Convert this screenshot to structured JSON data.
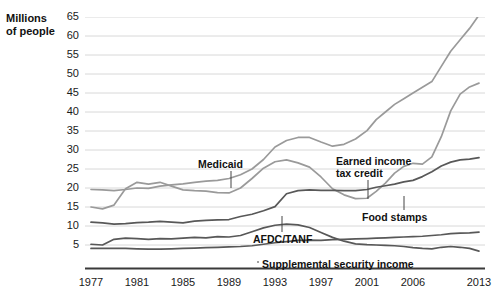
{
  "axis_title": "Millions\nof people",
  "axis_title_line1": "Millions",
  "axis_title_line2": "of people",
  "colors": {
    "light_series": "#9a9a9a",
    "dark_series": "#585858",
    "grid": "#d8d8d8",
    "axis": "#3a3a3a",
    "text": "#111111"
  },
  "annotations": {
    "medicaid": "Medicaid",
    "eitc_line1": "Earned income",
    "eitc_line2": "tax credit",
    "food_stamps": "Food stamps",
    "afdc": "AFDC/TANF",
    "ssi": "Supplemental security income"
  },
  "chart_data": {
    "type": "line",
    "title": "",
    "subtitle": "",
    "xlabel": "",
    "ylabel": "Millions of people",
    "ylim": [
      0,
      65
    ],
    "xlim": [
      1977,
      2013
    ],
    "grid": true,
    "legend": "inline-annotations",
    "ytick_labels": [
      "65",
      "60",
      "55",
      "50",
      "45",
      "40",
      "35",
      "30",
      "25",
      "20",
      "15",
      "10",
      "5"
    ],
    "yticks": [
      65,
      60,
      55,
      50,
      45,
      40,
      35,
      30,
      25,
      20,
      15,
      10,
      5
    ],
    "xtick_labels": [
      "1977",
      "1981",
      "1985",
      "1989",
      "1993",
      "1997",
      "2001",
      "2006",
      "2013"
    ],
    "xticks": [
      1977,
      1981,
      1985,
      1989,
      1993,
      1997,
      2001,
      2006,
      2013
    ],
    "series": [
      {
        "name": "Medicaid",
        "color": "#9a9a9a",
        "x": [
          1977,
          1978,
          1979,
          1980,
          1981,
          1982,
          1983,
          1984,
          1985,
          1986,
          1987,
          1988,
          1989,
          1990,
          1991,
          1992,
          1993,
          1994,
          1995,
          1996,
          1997,
          1998,
          1999,
          2000,
          2001,
          2002,
          2003,
          2004,
          2005,
          2006,
          2007,
          2008,
          2009,
          2010,
          2011,
          2012,
          2013
        ],
        "values": [
          19.6,
          19.5,
          19.3,
          19.6,
          20.0,
          19.9,
          20.5,
          20.8,
          21.1,
          21.5,
          21.8,
          22.0,
          22.5,
          23.5,
          25.0,
          27.5,
          30.8,
          32.5,
          33.3,
          33.3,
          32.1,
          31.0,
          31.5,
          32.9,
          35.1,
          38.0,
          40.0,
          42.0,
          43.5,
          45.0,
          46.5,
          48.0,
          52.0,
          56.0,
          59.0,
          62.0,
          65.5
        ]
      },
      {
        "name": "Food stamps",
        "color": "#9a9a9a",
        "x": [
          1977,
          1978,
          1979,
          1980,
          1981,
          1982,
          1983,
          1984,
          1985,
          1986,
          1987,
          1988,
          1989,
          1990,
          1991,
          1992,
          1993,
          1994,
          1995,
          1996,
          1997,
          1998,
          1999,
          2000,
          2001,
          2002,
          2003,
          2004,
          2005,
          2006,
          2007,
          2008,
          2009,
          2010,
          2011,
          2012,
          2013
        ],
        "values": [
          15.0,
          14.5,
          15.5,
          19.8,
          21.5,
          21.0,
          21.5,
          20.5,
          19.5,
          19.3,
          19.2,
          18.8,
          18.7,
          20.0,
          22.5,
          25.2,
          26.9,
          27.4,
          26.6,
          25.5,
          22.9,
          19.8,
          18.2,
          17.2,
          17.3,
          19.1,
          21.3,
          23.9,
          25.7,
          26.5,
          26.3,
          28.2,
          33.5,
          40.3,
          44.7,
          46.6,
          47.6
        ]
      },
      {
        "name": "Earned income tax credit",
        "color": "#585858",
        "x": [
          1977,
          1978,
          1979,
          1980,
          1981,
          1982,
          1983,
          1984,
          1985,
          1986,
          1987,
          1988,
          1989,
          1990,
          1991,
          1992,
          1993,
          1994,
          1995,
          1996,
          1997,
          1998,
          1999,
          2000,
          2001,
          2002,
          2003,
          2004,
          2005,
          2006,
          2007,
          2008,
          2009,
          2010,
          2011,
          2012,
          2013
        ],
        "values": [
          11.0,
          10.8,
          10.5,
          10.6,
          10.9,
          11.0,
          11.2,
          11.0,
          10.8,
          11.3,
          11.5,
          11.6,
          11.7,
          12.5,
          13.1,
          14.0,
          15.1,
          18.5,
          19.3,
          19.5,
          19.4,
          19.4,
          19.3,
          19.3,
          19.6,
          20.2,
          20.6,
          21.0,
          21.6,
          22.0,
          23.0,
          24.3,
          25.8,
          26.8,
          27.4,
          27.6,
          28.0
        ]
      },
      {
        "name": "AFDC/TANF",
        "color": "#585858",
        "x": [
          1977,
          1978,
          1979,
          1980,
          1981,
          1982,
          1983,
          1984,
          1985,
          1986,
          1987,
          1988,
          1989,
          1990,
          1991,
          1992,
          1993,
          1994,
          1995,
          1996,
          1997,
          1998,
          1999,
          2000,
          2001,
          2002,
          2003,
          2004,
          2005,
          2006,
          2007,
          2008,
          2009,
          2010,
          2011,
          2012,
          2013
        ],
        "values": [
          5.2,
          5.0,
          6.5,
          6.8,
          6.7,
          6.5,
          6.7,
          6.6,
          6.8,
          7.0,
          6.9,
          7.2,
          7.1,
          7.5,
          8.5,
          9.5,
          10.2,
          10.5,
          10.3,
          9.6,
          8.3,
          7.0,
          6.0,
          5.3,
          5.1,
          5.0,
          4.9,
          4.8,
          4.6,
          4.3,
          4.1,
          4.0,
          4.4,
          4.6,
          4.4,
          4.1,
          3.4
        ]
      },
      {
        "name": "Supplemental security income",
        "color": "#585858",
        "x": [
          1977,
          1978,
          1979,
          1980,
          1981,
          1982,
          1983,
          1984,
          1985,
          1986,
          1987,
          1988,
          1989,
          1990,
          1991,
          1992,
          1993,
          1994,
          1995,
          1996,
          1997,
          1998,
          1999,
          2000,
          2001,
          2002,
          2003,
          2004,
          2005,
          2006,
          2007,
          2008,
          2009,
          2010,
          2011,
          2012,
          2013
        ],
        "values": [
          4.1,
          4.1,
          4.1,
          4.1,
          4.0,
          3.9,
          3.9,
          4.0,
          4.1,
          4.2,
          4.3,
          4.4,
          4.5,
          4.6,
          4.8,
          5.2,
          5.6,
          5.9,
          6.2,
          6.3,
          6.2,
          6.4,
          6.5,
          6.6,
          6.7,
          6.8,
          6.9,
          7.0,
          7.1,
          7.2,
          7.3,
          7.5,
          7.7,
          8.0,
          8.1,
          8.2,
          8.4
        ]
      }
    ]
  }
}
